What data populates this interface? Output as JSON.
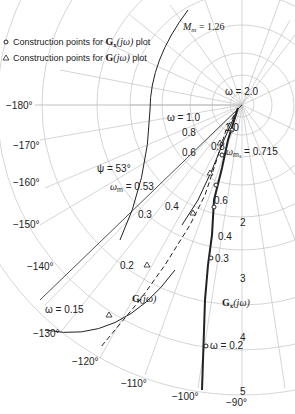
{
  "legend": {
    "items": [
      {
        "marker": "circle",
        "text": "Construction points for ",
        "symbol": "Gx(jω)",
        "suffix": " plot"
      },
      {
        "marker": "triangle",
        "text": "Construction points for ",
        "symbol": "G(jω)",
        "suffix": " plot"
      }
    ]
  },
  "annotations": {
    "mm": "M",
    "mm_sub": "m",
    "mm_val": " = 1.26",
    "psi": "ψ = 53°",
    "omega_m": "ω",
    "omega_m_sub": "m",
    "omega_m_val": " = 0.53",
    "omega_m1": "ω",
    "omega_m1_sub": "m₁",
    "omega_m1_val": " = 0.715",
    "w20": "ω = 2.0",
    "w10": "ω = 1.0",
    "w015": "ω = 0.15",
    "w02": "ω = 0.2",
    "g_label": "G(jω)",
    "gx_label": "Gₓ(jω)"
  },
  "gx_points": [
    "1.0",
    "0.8",
    "0.6",
    "0.4",
    "0.3"
  ],
  "g_points": [
    "0.8",
    "0.6",
    "0.4",
    "0.3",
    "0.2"
  ],
  "phase_labels": [
    "−180°",
    "−170°",
    "−160°",
    "−150°",
    "−140°",
    "−130°",
    "−120°",
    "−110°",
    "−100°",
    "−90°"
  ],
  "magnitude_labels": [
    "2",
    "3",
    "4",
    "5"
  ]
}
